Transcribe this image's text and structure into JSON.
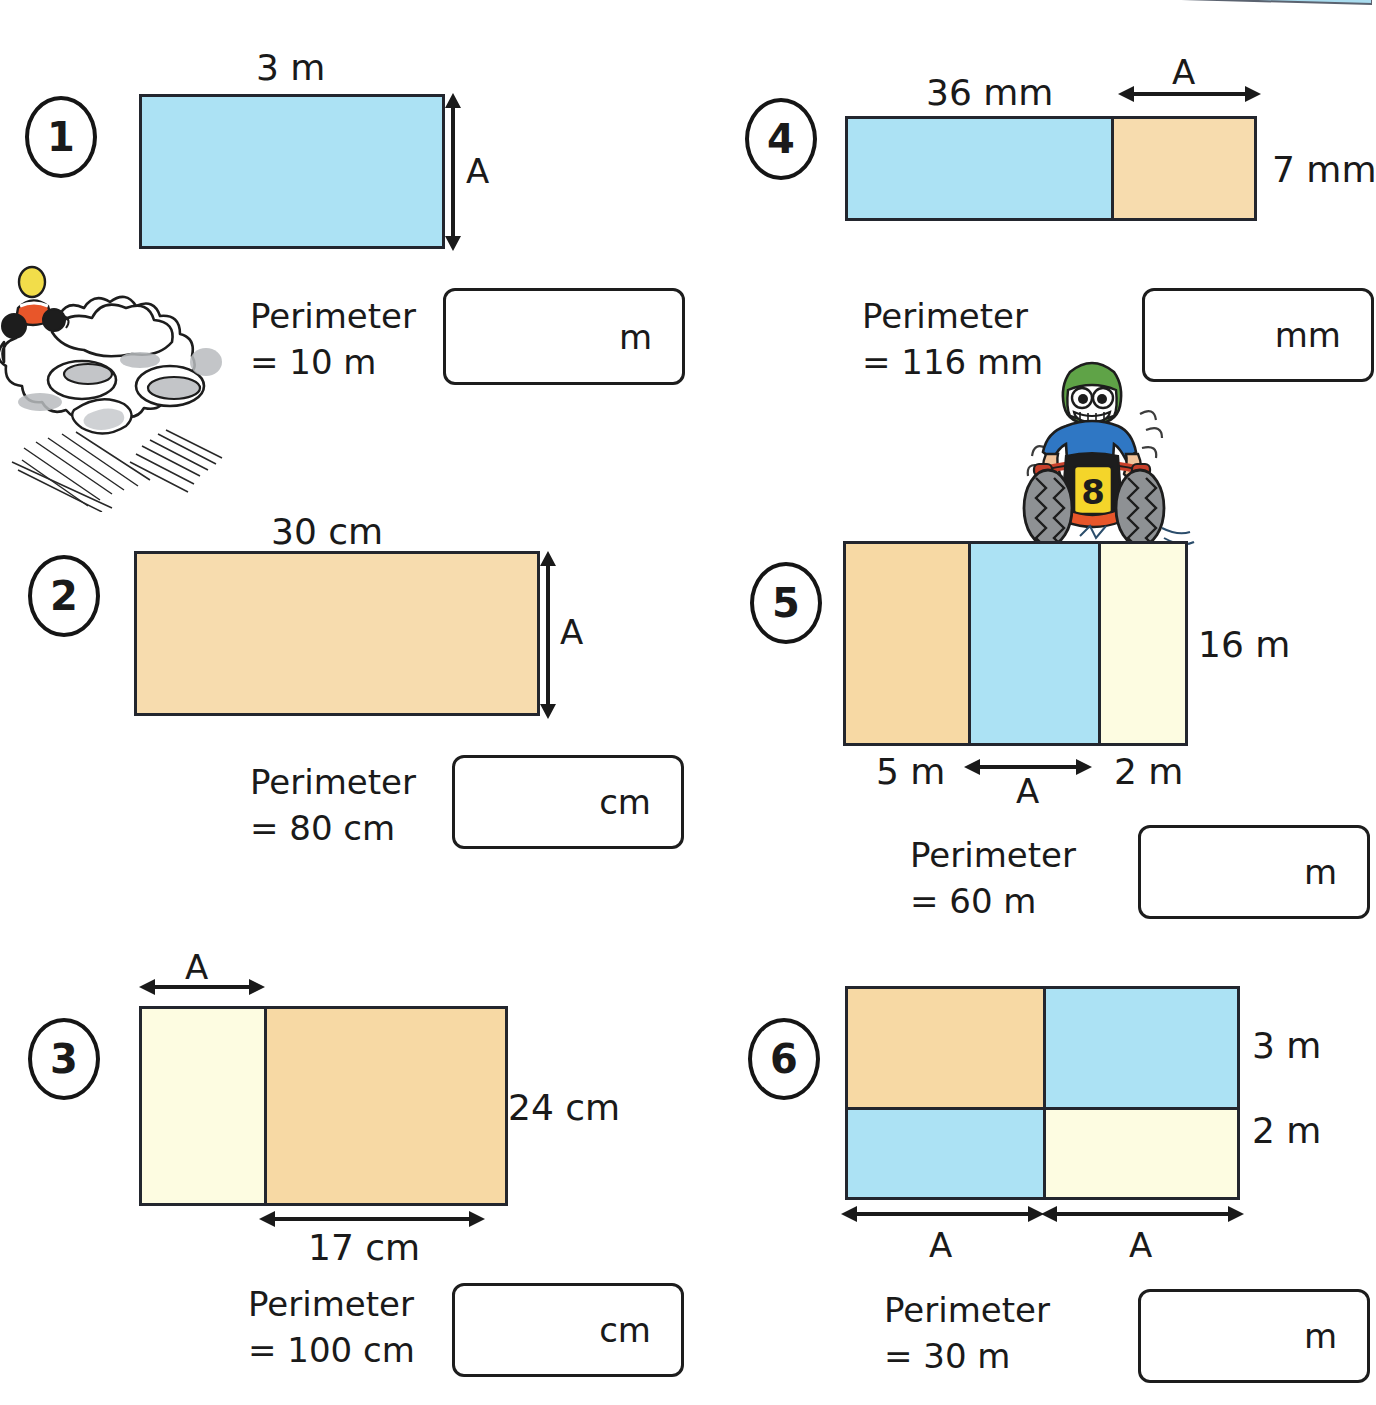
{
  "worksheet": {
    "unit_label_m": "m",
    "unit_label_cm": "cm",
    "unit_label_mm": "mm",
    "letter_a": "A"
  },
  "problems": [
    {
      "number": "1",
      "top_label": "3 m",
      "side_label": "A",
      "perimeter_line1": "Perimeter",
      "perimeter_line2": "= 10 m",
      "answer_unit": "m",
      "shape": {
        "type": "single-rect",
        "segments": [
          {
            "color": "#ace2f4",
            "label": "3 m"
          }
        ],
        "height_label": "A"
      }
    },
    {
      "number": "2",
      "top_label": "30 cm",
      "side_label": "A",
      "perimeter_line1": "Perimeter",
      "perimeter_line2": "= 80 cm",
      "answer_unit": "cm",
      "shape": {
        "type": "single-rect",
        "segments": [
          {
            "color": "#f7dcae",
            "label": "30 cm"
          }
        ],
        "height_label": "A"
      }
    },
    {
      "number": "3",
      "top_label": "A",
      "side_label": "24 cm",
      "bottom_label": "17 cm",
      "perimeter_line1": "Perimeter",
      "perimeter_line2": "= 100 cm",
      "answer_unit": "cm",
      "shape": {
        "type": "two-column-rect",
        "segments": [
          {
            "color": "#fdfce1",
            "label": "A"
          },
          {
            "color": "#f7d9a4",
            "label": "17 cm"
          }
        ],
        "height_label": "24 cm"
      }
    },
    {
      "number": "4",
      "top_label": "36 mm",
      "top_label_2": "A",
      "side_label": "7 mm",
      "perimeter_line1": "Perimeter",
      "perimeter_line2": "= 116 mm",
      "answer_unit": "mm",
      "shape": {
        "type": "two-column-rect",
        "segments": [
          {
            "color": "#ace2f4",
            "label": "36 mm"
          },
          {
            "color": "#f7dcae",
            "label": "A"
          }
        ],
        "height_label": "7 mm"
      }
    },
    {
      "number": "5",
      "side_label": "16 m",
      "bottom_label_1": "5 m",
      "bottom_label_2": "A",
      "bottom_label_3": "2 m",
      "perimeter_line1": "Perimeter",
      "perimeter_line2": "= 60 m",
      "answer_unit": "m",
      "shape": {
        "type": "three-column-rect",
        "segments": [
          {
            "color": "#f7d9a4",
            "label": "5 m"
          },
          {
            "color": "#ace2f4",
            "label": "A"
          },
          {
            "color": "#fdfce1",
            "label": "2 m"
          }
        ],
        "height_label": "16 m"
      }
    },
    {
      "number": "6",
      "side_label_1": "3 m",
      "side_label_2": "2 m",
      "bottom_label_1": "A",
      "bottom_label_2": "A",
      "perimeter_line1": "Perimeter",
      "perimeter_line2": "= 30 m",
      "answer_unit": "m",
      "shape": {
        "type": "grid-2x2",
        "cells": [
          [
            {
              "color": "#f7d9a4"
            },
            {
              "color": "#ace2f4"
            }
          ],
          [
            {
              "color": "#ace2f4"
            },
            {
              "color": "#fdfce1"
            }
          ]
        ],
        "row_labels": [
          "3 m",
          "2 m"
        ],
        "col_labels": [
          "A",
          "A"
        ]
      }
    }
  ],
  "illustrations": [
    {
      "name": "dust-cloud-quadbike",
      "rider_helmet_color": "#f2dd4a",
      "bike_color": "#e8562a"
    },
    {
      "name": "quad-bike-rider",
      "helmet_color": "#5fa347",
      "shirt_color": "#2f77c4",
      "plate_number": "8",
      "plate_color": "#f4d52a"
    }
  ],
  "colors": {
    "blue": "#ace2f4",
    "orange": "#f7d9a4",
    "cream": "#fdfce1",
    "outline": "#23262e",
    "text": "#1a1a1a",
    "banner_blue": "#a9dcef"
  }
}
